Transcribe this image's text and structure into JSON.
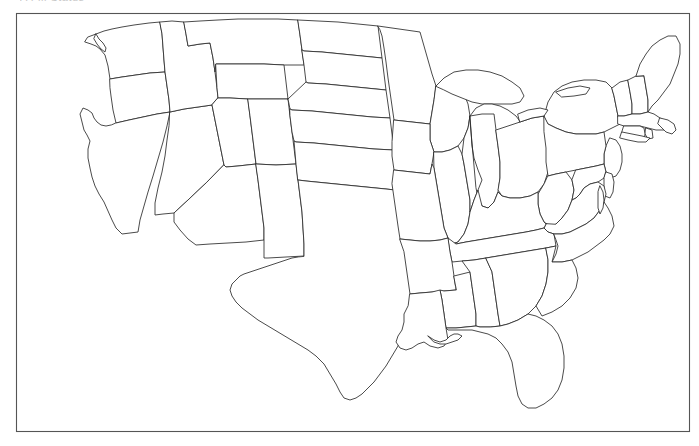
{
  "document": {
    "kind": "blank-outline-map",
    "subject": "Contiguous United States state boundaries",
    "header_text": "A Fill Status",
    "background_color": "#ffffff",
    "outline_color": "#2b2b2b",
    "frame_color": "#555555",
    "fill_color": "#ffffff",
    "labels_shown": "none",
    "width": 699,
    "height": 446
  },
  "frame": {
    "name": "map-border-rectangle",
    "x": 16,
    "y": 13,
    "width": 674,
    "height": 419
  },
  "map": {
    "title": "",
    "projection_note": "conic-like, curved northern and southern borders",
    "regions_depicted": [
      "Pacific Northwest",
      "California",
      "Southwest",
      "Rocky Mountains",
      "Great Plains",
      "Great Lakes",
      "Midwest",
      "Northeast",
      "Mid-Atlantic",
      "Southeast",
      "Gulf Coast"
    ],
    "states": [
      {
        "code": "WA",
        "name": "Washington"
      },
      {
        "code": "OR",
        "name": "Oregon"
      },
      {
        "code": "CA",
        "name": "California"
      },
      {
        "code": "NV",
        "name": "Nevada"
      },
      {
        "code": "ID",
        "name": "Idaho"
      },
      {
        "code": "MT",
        "name": "Montana"
      },
      {
        "code": "WY",
        "name": "Wyoming"
      },
      {
        "code": "UT",
        "name": "Utah"
      },
      {
        "code": "AZ",
        "name": "Arizona"
      },
      {
        "code": "CO",
        "name": "Colorado"
      },
      {
        "code": "NM",
        "name": "New Mexico"
      },
      {
        "code": "ND",
        "name": "North Dakota"
      },
      {
        "code": "SD",
        "name": "South Dakota"
      },
      {
        "code": "NE",
        "name": "Nebraska"
      },
      {
        "code": "KS",
        "name": "Kansas"
      },
      {
        "code": "OK",
        "name": "Oklahoma"
      },
      {
        "code": "TX",
        "name": "Texas"
      },
      {
        "code": "MN",
        "name": "Minnesota"
      },
      {
        "code": "IA",
        "name": "Iowa"
      },
      {
        "code": "MO",
        "name": "Missouri"
      },
      {
        "code": "AR",
        "name": "Arkansas"
      },
      {
        "code": "LA",
        "name": "Louisiana"
      },
      {
        "code": "WI",
        "name": "Wisconsin"
      },
      {
        "code": "IL",
        "name": "Illinois"
      },
      {
        "code": "MI",
        "name": "Michigan"
      },
      {
        "code": "IN",
        "name": "Indiana"
      },
      {
        "code": "OH",
        "name": "Ohio"
      },
      {
        "code": "KY",
        "name": "Kentucky"
      },
      {
        "code": "TN",
        "name": "Tennessee"
      },
      {
        "code": "MS",
        "name": "Mississippi"
      },
      {
        "code": "AL",
        "name": "Alabama"
      },
      {
        "code": "GA",
        "name": "Georgia"
      },
      {
        "code": "FL",
        "name": "Florida"
      },
      {
        "code": "SC",
        "name": "South Carolina"
      },
      {
        "code": "NC",
        "name": "North Carolina"
      },
      {
        "code": "VA",
        "name": "Virginia"
      },
      {
        "code": "WV",
        "name": "West Virginia"
      },
      {
        "code": "MD",
        "name": "Maryland"
      },
      {
        "code": "DE",
        "name": "Delaware"
      },
      {
        "code": "NJ",
        "name": "New Jersey"
      },
      {
        "code": "PA",
        "name": "Pennsylvania"
      },
      {
        "code": "NY",
        "name": "New York"
      },
      {
        "code": "CT",
        "name": "Connecticut"
      },
      {
        "code": "RI",
        "name": "Rhode Island"
      },
      {
        "code": "MA",
        "name": "Massachusetts"
      },
      {
        "code": "VT",
        "name": "Vermont"
      },
      {
        "code": "NH",
        "name": "New Hampshire"
      },
      {
        "code": "ME",
        "name": "Maine"
      }
    ],
    "water_features": [
      "Lake Superior",
      "Lake Michigan",
      "Lake Huron",
      "Lake Erie",
      "Lake Ontario",
      "Chesapeake Bay",
      "San Francisco Bay",
      "Gulf of Mexico coastline",
      "Atlantic coastline",
      "Pacific coastline"
    ]
  }
}
